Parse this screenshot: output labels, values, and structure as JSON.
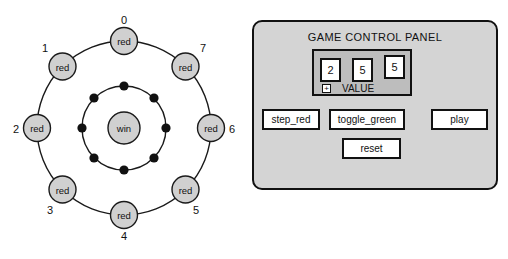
{
  "ring_diagram": {
    "name": "game-state-ring",
    "outer_nodes": [
      {
        "index": "0",
        "label": "red",
        "angle_deg": 90,
        "index_pos": "above"
      },
      {
        "index": "1",
        "label": "red",
        "angle_deg": 135,
        "index_pos": "upper-left"
      },
      {
        "index": "2",
        "label": "red",
        "angle_deg": 180,
        "index_pos": "left"
      },
      {
        "index": "3",
        "label": "red",
        "angle_deg": 225,
        "index_pos": "lower-left"
      },
      {
        "index": "4",
        "label": "red",
        "angle_deg": 270,
        "index_pos": "below"
      },
      {
        "index": "5",
        "label": "red",
        "angle_deg": 315,
        "index_pos": "lower-right"
      },
      {
        "index": "6",
        "label": "red",
        "angle_deg": 0,
        "index_pos": "right"
      },
      {
        "index": "7",
        "label": "red",
        "angle_deg": 45,
        "index_pos": "upper-right"
      }
    ],
    "inner_dot_count": 8,
    "center_node": {
      "label": "win"
    },
    "colors": {
      "node_fill": "#d0d0d0",
      "stroke": "#1a1a1a",
      "dot_fill": "#111111"
    }
  },
  "control_panel": {
    "title": "GAME CONTROL PANEL",
    "value_group": {
      "digits": [
        "2",
        "5",
        "5"
      ],
      "expander_icon": "plus-icon",
      "expander_symbol": "+",
      "caption": "VALUE"
    },
    "buttons": [
      {
        "name": "step_red",
        "label": "step_red"
      },
      {
        "name": "toggle_green",
        "label": "toggle_green"
      },
      {
        "name": "play",
        "label": "play"
      },
      {
        "name": "reset",
        "label": "reset"
      }
    ],
    "colors": {
      "panel_bg": "#d4d4d4",
      "group_bg": "#bdbdbd",
      "button_bg": "#ffffff",
      "border": "#111111"
    }
  }
}
